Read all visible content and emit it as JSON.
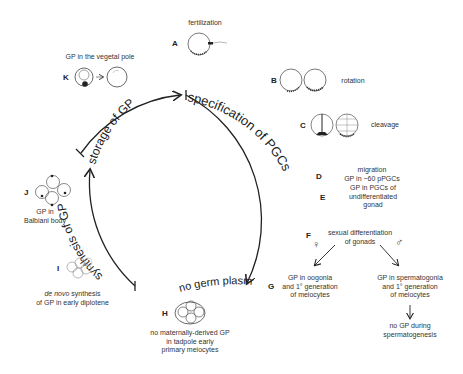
{
  "cycle": {
    "arcs": [
      {
        "id": "specification",
        "label": "specification of PGCs"
      },
      {
        "id": "storage",
        "label": "storage of GP"
      },
      {
        "id": "synthesis",
        "label": "synthesis of GP"
      },
      {
        "id": "no-germ-plasm",
        "label": "no germ plasm"
      }
    ]
  },
  "stages": [
    {
      "letter": "A",
      "label": "fertilization"
    },
    {
      "letter": "B",
      "label": "rotation"
    },
    {
      "letter": "C",
      "label": "cleavage"
    },
    {
      "letter": "D",
      "label_lines": [
        "migration",
        "GP in ~60 pPGCs"
      ]
    },
    {
      "letter": "E",
      "label_lines": [
        "GP in PGCs of",
        "undifferentiated",
        "gonad"
      ]
    },
    {
      "letter": "F",
      "label_lines": [
        "sexual differentiation",
        "of gonads"
      ]
    },
    {
      "letter": "G",
      "female_lines": [
        "GP in oogonia",
        "and 1° generation",
        "of meiocytes"
      ],
      "male_lines": [
        "GP in spermatogonia",
        "and 1° generation",
        "of meiocytes"
      ],
      "male_followup_lines": [
        "no GP during",
        "spermatogenesis"
      ]
    },
    {
      "letter": "H",
      "label_lines": [
        "no maternally-derived GP",
        "in tadpole early",
        "primary meiocytes"
      ]
    },
    {
      "letter": "I",
      "label_italic": "de novo",
      "label_rest": " synthesis",
      "label_line2": "of GP in early diplotene"
    },
    {
      "letter": "J",
      "label_lines": [
        "GP in",
        "Balbiani body"
      ]
    },
    {
      "letter": "K",
      "label": "GP in the vegetal pole"
    }
  ],
  "symbols": {
    "female": "♀",
    "male": "♂"
  },
  "colors": {
    "ink": "#222222",
    "text": "#333333",
    "cell_outline": "#666666",
    "background": "#ffffff"
  }
}
